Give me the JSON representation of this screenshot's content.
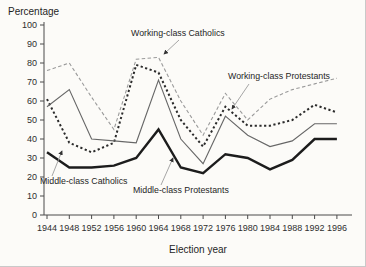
{
  "figure": {
    "background": "#fcfbf8",
    "border_color": "#c9c9c9"
  },
  "chart_data": {
    "type": "line",
    "title": "",
    "ylabel": "Percentage",
    "xlabel": "Election year",
    "x": [
      1944,
      1948,
      1952,
      1956,
      1960,
      1964,
      1968,
      1972,
      1976,
      1980,
      1984,
      1988,
      1992,
      1996
    ],
    "x_tick_labels": [
      "1944",
      "1948",
      "1952",
      "1956",
      "1960",
      "1964",
      "1968",
      "1972",
      "1976",
      "1980",
      "1984",
      "1988",
      "1992",
      "1996"
    ],
    "y_ticks": [
      0,
      10,
      20,
      30,
      40,
      50,
      60,
      70,
      80,
      90,
      100
    ],
    "y_tick_labels": [
      "0",
      "10",
      "20",
      "30",
      "40",
      "50",
      "60",
      "70",
      "80",
      "90",
      "100"
    ],
    "xlim": [
      1944,
      1996
    ],
    "ylim": [
      0,
      100
    ],
    "grid": false,
    "legend_position": "inline-annotations",
    "series": [
      {
        "name": "Working-class Catholics",
        "line_style": "light-dashed-thin",
        "color": "#9a9a9a",
        "width": 1.1,
        "dash": "3.5 2.4",
        "values": [
          76,
          80,
          62,
          45,
          82,
          83,
          60,
          42,
          64,
          50,
          61,
          66,
          69,
          72
        ]
      },
      {
        "name": "Middle-class Catholics",
        "line_style": "bold-dotted",
        "color": "#2b2b2b",
        "width": 2,
        "dash": "2.2 2.5",
        "values": [
          61,
          38,
          33,
          38,
          79,
          75,
          50,
          36,
          57,
          47,
          47,
          50,
          58,
          54
        ]
      },
      {
        "name": "Working-class Protestants",
        "line_style": "solid-thin",
        "color": "#676767",
        "width": 1.1,
        "dash": "",
        "values": [
          57,
          66,
          40,
          39,
          38,
          71,
          40,
          27,
          52,
          42,
          36,
          39,
          48,
          48
        ]
      },
      {
        "name": "Middle-class Protestants",
        "line_style": "solid-thick",
        "color": "#1c1c1c",
        "width": 2.4,
        "dash": "",
        "values": [
          33,
          25,
          25,
          26,
          30,
          45,
          25,
          22,
          32,
          30,
          24,
          29,
          40,
          40
        ]
      }
    ],
    "annotations": [
      {
        "text": "Working-class Catholics",
        "x": 131,
        "y": 36,
        "anchor": "start",
        "arrow": {
          "x1": 179,
          "y1": 40,
          "x2": 164,
          "y2": 54
        }
      },
      {
        "text": "Working-class Protestants",
        "x": 228,
        "y": 79,
        "anchor": "start",
        "arrow": {
          "x1": 249,
          "y1": 84,
          "x2": 232,
          "y2": 109
        }
      },
      {
        "text": "Middle-class Catholics",
        "x": 40,
        "y": 184,
        "anchor": "start",
        "arrow": {
          "x1": 52,
          "y1": 176,
          "x2": 62,
          "y2": 151
        }
      },
      {
        "text": "Middle-class Protestants",
        "x": 133,
        "y": 193,
        "anchor": "start",
        "arrow": {
          "x1": 161,
          "y1": 185,
          "x2": 173,
          "y2": 158
        }
      }
    ],
    "layout": {
      "plot": {
        "x_left": 44,
        "x_right": 352,
        "y_top": 22,
        "y_bottom": 215
      },
      "x_scale": {
        "x_1944": 47,
        "px_per_4yr": 22.3
      },
      "y_scale": {
        "y_at_0": 215,
        "px_per_unit": 1.9
      },
      "axis_color": "#4a4a4a",
      "tick_len": 4,
      "tick_label_color": "#2e2e2e",
      "tick_font_size": 9,
      "axis_title_font_size": 10,
      "annotation_font_size": 8.8,
      "annotation_color": "#1f1f1f",
      "arrow_color": "#9c9c9c",
      "arrowhead_color": "#333333"
    }
  }
}
